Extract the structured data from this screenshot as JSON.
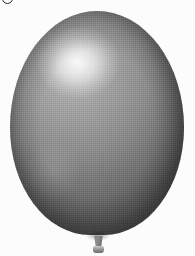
{
  "canvas": {
    "width": 195,
    "height": 256,
    "background_color": "#fcfcfc",
    "description": "Greyscale photograph of a single inflated balloon on a plain near-white background, reproduced with a visible halftone print texture."
  },
  "artifacts": {
    "glyph_fragment": {
      "name": "clipped-glyph-fragment",
      "description": "Bottom sliver of a dark rounded character clipped by the top-left image edge",
      "color": "#2a2a2a",
      "x": 2,
      "y": 0,
      "width": 9,
      "height": 3
    }
  },
  "balloon": {
    "label": "balloon",
    "body": {
      "name": "balloon-body",
      "shape": "ellipse",
      "x": 10,
      "y": 11,
      "width": 174,
      "height": 224,
      "widest_row_y": 130,
      "base_color": "#7e7e7e",
      "midtone_color": "#8a8a8a",
      "light_color": "#b4b4b4",
      "shadow_color": "#555555",
      "deep_shadow_color": "#4f4f4f"
    },
    "highlight": {
      "name": "specular-highlight",
      "center_x": 78,
      "center_y": 62,
      "radius_x": 26,
      "radius_y": 22,
      "color": "#f0f0f0"
    },
    "texture": {
      "name": "halftone-texture",
      "pattern": "dither-grid",
      "cell_size": 2,
      "opacity": 0.85
    },
    "neck": {
      "name": "balloon-neck",
      "x": 92,
      "y": 236,
      "width": 13,
      "height": 12,
      "color": "#6e6e6e"
    },
    "lip": {
      "name": "balloon-lip",
      "x": 93,
      "y": 246,
      "width": 11,
      "height": 7,
      "color": "#9a9a9a"
    }
  }
}
